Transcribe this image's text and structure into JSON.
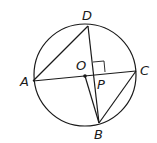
{
  "diagram": {
    "type": "circle-geometry",
    "circle": {
      "center": "O",
      "cx": 85,
      "cy": 75,
      "r": 51
    },
    "points": {
      "A": {
        "label": "A",
        "x": 33,
        "y": 81,
        "lx": 20,
        "ly": 86
      },
      "B": {
        "label": "B",
        "x": 99,
        "y": 123,
        "lx": 94,
        "ly": 139
      },
      "C": {
        "label": "C",
        "x": 136,
        "y": 71,
        "lx": 140,
        "ly": 75
      },
      "D": {
        "label": "D",
        "x": 88,
        "y": 26,
        "lx": 82,
        "ly": 20
      },
      "O": {
        "label": "O",
        "x": 85,
        "y": 76,
        "lx": 76,
        "ly": 70
      },
      "P": {
        "label": "P",
        "x": 94,
        "y": 74,
        "lx": 97,
        "ly": 89
      }
    },
    "segments": [
      "AD",
      "AC",
      "DB",
      "OB",
      "CB"
    ],
    "right_angle_at": "P",
    "stroke_color": "#1a1a1a"
  }
}
